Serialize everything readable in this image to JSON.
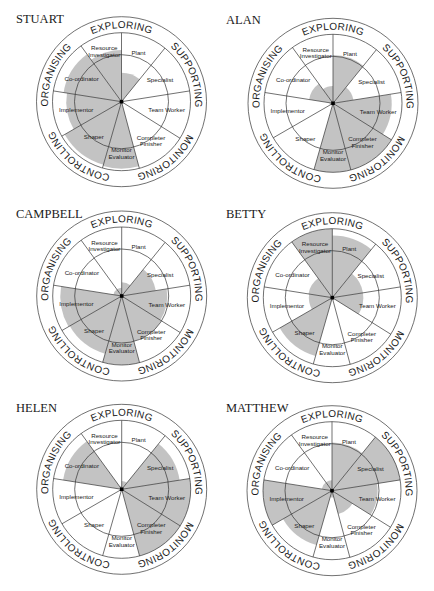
{
  "figure": {
    "type": "team-role-wheels",
    "ring_labels": [
      "EXPLORING",
      "SUPPORTING",
      "MONITORING",
      "CONTROLLING",
      "ORGANISING"
    ],
    "roles": [
      {
        "id": "plant",
        "label": [
          "Plant"
        ]
      },
      {
        "id": "specialist",
        "label": [
          "Specialist"
        ]
      },
      {
        "id": "team-worker",
        "label": [
          "Team Worker"
        ]
      },
      {
        "id": "completer-finisher",
        "label": [
          "Completer",
          "Finisher"
        ]
      },
      {
        "id": "monitor-evaluator",
        "label": [
          "Monitor",
          "Evaluator"
        ]
      },
      {
        "id": "shaper",
        "label": [
          "Shaper"
        ]
      },
      {
        "id": "implementor",
        "label": [
          "Implementor"
        ]
      },
      {
        "id": "co-ordinator",
        "label": [
          "Co-ordinator"
        ]
      },
      {
        "id": "resource-investigator",
        "label": [
          "Resource",
          "Investigator"
        ]
      }
    ],
    "shade_color": "#b8b8b8"
  },
  "chart_data": [
    {
      "type": "polar-area",
      "title": "STUART",
      "categories": [
        "Plant",
        "Specialist",
        "Team Worker",
        "Completer Finisher",
        "Monitor Evaluator",
        "Shaper",
        "Implementor",
        "Co-ordinator",
        "Resource Investigator"
      ],
      "values": [
        0.42,
        0,
        0,
        0,
        0.97,
        0.95,
        0.8,
        0.85,
        0.75
      ],
      "scale": "fraction of inner circle radius (0-1)"
    },
    {
      "type": "polar-area",
      "title": "ALAN",
      "categories": [
        "Plant",
        "Specialist",
        "Team Worker",
        "Completer Finisher",
        "Monitor Evaluator",
        "Shaper",
        "Implementor",
        "Co-ordinator",
        "Resource Investigator"
      ],
      "values": [
        0.7,
        0.3,
        0.85,
        1.0,
        1.0,
        0,
        0.05,
        0.35,
        0.25
      ],
      "scale": "fraction of inner circle radius (0-1)"
    },
    {
      "type": "polar-area",
      "title": "CAMPBELL",
      "categories": [
        "Plant",
        "Specialist",
        "Team Worker",
        "Completer Finisher",
        "Monitor Evaluator",
        "Shaper",
        "Implementor",
        "Co-ordinator",
        "Resource Investigator"
      ],
      "values": [
        0.2,
        0.5,
        0.66,
        0.68,
        1.0,
        0.87,
        0.89,
        0.12,
        0.12
      ],
      "scale": "fraction of inner circle radius (0-1)"
    },
    {
      "type": "polar-area",
      "title": "BETTY",
      "categories": [
        "Plant",
        "Specialist",
        "Team Worker",
        "Completer Finisher",
        "Monitor Evaluator",
        "Shaper",
        "Implementor",
        "Co-ordinator",
        "Resource Investigator"
      ],
      "values": [
        0.9,
        0.45,
        0.45,
        0,
        0,
        0.88,
        0.34,
        0.35,
        1.0
      ],
      "scale": "fraction of inner circle radius (0-1)"
    },
    {
      "type": "polar-area",
      "title": "HELEN",
      "categories": [
        "Plant",
        "Specialist",
        "Team Worker",
        "Completer Finisher",
        "Monitor Evaluator",
        "Shaper",
        "Implementor",
        "Co-ordinator",
        "Resource Investigator"
      ],
      "values": [
        0.12,
        0.85,
        1.0,
        1.0,
        0,
        0,
        0,
        0.86,
        0.05
      ],
      "scale": "fraction of inner circle radius (0-1)"
    },
    {
      "type": "polar-area",
      "title": "MATTHEW",
      "categories": [
        "Plant",
        "Specialist",
        "Team Worker",
        "Completer Finisher",
        "Monitor Evaluator",
        "Shaper",
        "Implementor",
        "Co-ordinator",
        "Resource Investigator"
      ],
      "values": [
        0.7,
        1.0,
        0.66,
        0.35,
        0.1,
        0.82,
        1.0,
        0.15,
        0.15
      ],
      "scale": "fraction of inner circle radius (0-1)"
    }
  ]
}
